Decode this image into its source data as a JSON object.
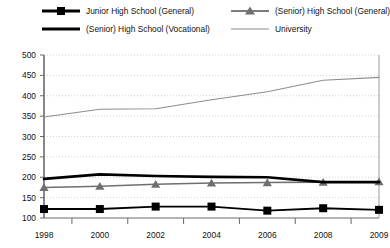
{
  "chart_data": {
    "type": "line",
    "title": "",
    "xlabel": "",
    "ylabel": "",
    "categories": [
      "1998",
      "2000",
      "2002",
      "2004",
      "2006",
      "2008",
      "2009"
    ],
    "ylim": [
      100,
      500
    ],
    "ytick_step": 50,
    "yticks": [
      "500",
      "450",
      "400",
      "350",
      "300",
      "250",
      "200",
      "150",
      "100"
    ],
    "grid": true,
    "legend_position": "top",
    "series": [
      {
        "name": "Junior High School (General)",
        "marker": "square",
        "color": "#000000",
        "values": [
          122,
          122,
          128,
          128,
          118,
          124,
          120
        ]
      },
      {
        "name": "(Senior) High School (General)",
        "marker": "triangle",
        "color": "#6f6f6f",
        "values": [
          175,
          178,
          183,
          186,
          187,
          188,
          189
        ]
      },
      {
        "name": "(Senior) High School (Vocational)",
        "marker": "none",
        "color": "#000000",
        "values": [
          196,
          207,
          203,
          201,
          200,
          188,
          188
        ]
      },
      {
        "name": "University",
        "marker": "none",
        "color": "#8d8d8d",
        "values": [
          348,
          367,
          368,
          390,
          410,
          438,
          445
        ]
      }
    ]
  },
  "legend": {
    "items": [
      {
        "label": "Junior High School (General)",
        "key": "square-marker-line-key"
      },
      {
        "label": "(Senior) High School (Vocational)",
        "key": "thick-line-key"
      },
      {
        "label": "(Senior) High School (General)",
        "key": "triangle-marker-line-key"
      },
      {
        "label": "University",
        "key": "thin-gray-line-key"
      }
    ]
  },
  "axes": {
    "y_ticks": [
      "500",
      "450",
      "400",
      "350",
      "300",
      "250",
      "200",
      "150",
      "100"
    ],
    "x_ticks": [
      "1998",
      "2000",
      "2002",
      "2004",
      "2006",
      "2008",
      "2009"
    ]
  }
}
